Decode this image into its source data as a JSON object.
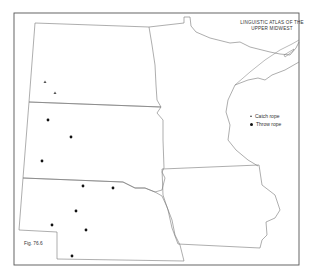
{
  "title": {
    "line1": "LINGUISTIC ATLAS OF THE",
    "line2": "UPPER MIDWEST"
  },
  "legend": {
    "items": [
      {
        "symbol": "triangle",
        "label": "Catch rope"
      },
      {
        "symbol": "dot",
        "label": "Throw rope"
      }
    ]
  },
  "figure_label": "Fig. 76.6",
  "states": [
    "North Dakota",
    "South Dakota",
    "Nebraska",
    "Minnesota",
    "Iowa"
  ],
  "points": {
    "catch_rope": [
      [
        45,
        82
      ],
      [
        55,
        93
      ]
    ],
    "throw_rope": [
      [
        48,
        120
      ],
      [
        71,
        137
      ],
      [
        42,
        161
      ],
      [
        83,
        186
      ],
      [
        113,
        188
      ],
      [
        76,
        211
      ],
      [
        52,
        225
      ],
      [
        86,
        230
      ],
      [
        72,
        256
      ]
    ]
  },
  "colors": {
    "line": "#666666",
    "marker": "#111111"
  }
}
